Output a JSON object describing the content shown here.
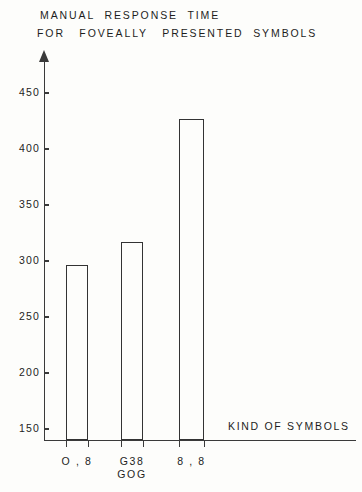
{
  "chart_data": {
    "type": "bar",
    "title": "MANUAL RESPONSE TIME FOR FOVEALLY PRESENTED SYMBOLS",
    "title_lines": [
      "MANUAL  RESPONSE  TIME",
      "FOR   FOVEALLY   PRESENTED  SYMBOLS"
    ],
    "xlabel": "KIND OF SYMBOLS",
    "ylabel": "",
    "ylim": [
      150,
      450
    ],
    "ytick_step": 50,
    "yticks": [
      150,
      200,
      250,
      300,
      350,
      400,
      450
    ],
    "ytick_labels": [
      "150",
      "200",
      "250",
      "300",
      "350",
      "400",
      "450"
    ],
    "grid": false,
    "legend": false,
    "bar_style": "outline",
    "bar_fill": "#fdfdfb",
    "bar_edge_color": "#333333",
    "axis_color": "#3a3a3a",
    "background": "#fdfdfb",
    "categories": [
      "O , 8",
      "G38 / GOG",
      "8 , 8"
    ],
    "category_labels": [
      {
        "lines": [
          "O , 8"
        ]
      },
      {
        "lines": [
          "G38",
          "GOG"
        ]
      },
      {
        "lines": [
          "8 , 8"
        ]
      }
    ],
    "values": [
      296,
      317,
      427
    ],
    "units": "ms"
  },
  "axis_title": {
    "x": "KIND OF SYMBOLS"
  }
}
